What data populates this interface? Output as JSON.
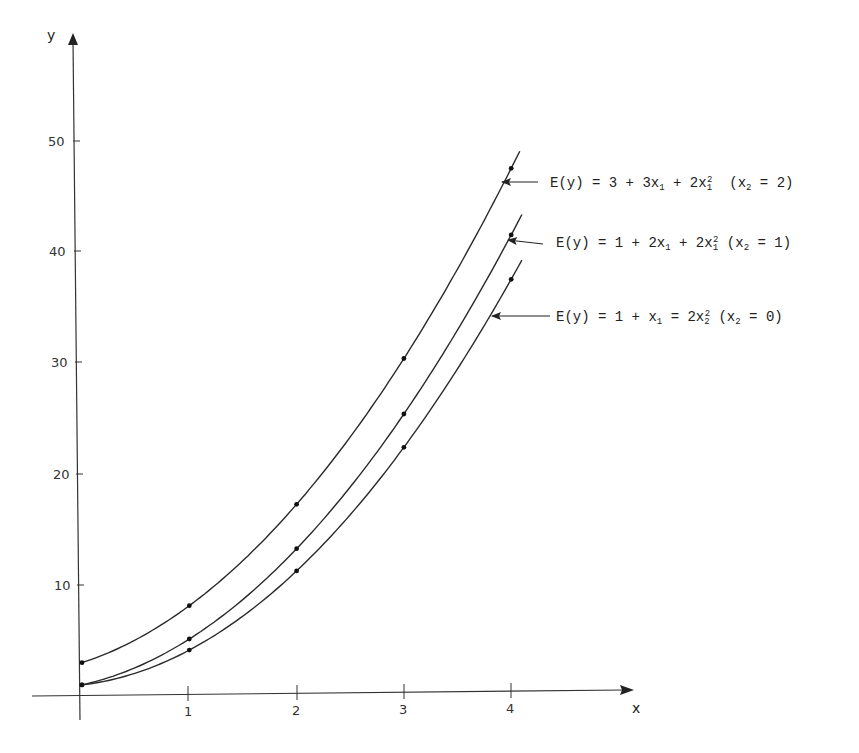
{
  "chart_data": {
    "type": "line",
    "title": "",
    "xlabel": "x",
    "ylabel": "y",
    "xlim": [
      0,
      4.5
    ],
    "ylim": [
      0,
      55
    ],
    "grid": false,
    "x_ticks": [
      "1",
      "2",
      "3",
      "4"
    ],
    "y_ticks": [
      "10",
      "20",
      "30",
      "40",
      "50"
    ],
    "x": [
      0,
      1,
      2,
      3,
      4
    ],
    "series": [
      {
        "name": "E(y) = 3 + 3x1 + 2x1^2 (x2 = 2)",
        "label_parts": [
          "E(y) = 3 + 3x",
          "1",
          " + 2x",
          "1",
          "2",
          "  (x",
          "2",
          " = 2)"
        ],
        "values": [
          3,
          8,
          17,
          30,
          47
        ]
      },
      {
        "name": "E(y) = 1 + 2x1 + 2x1^2 (x2 = 1)",
        "label_parts": [
          "E(y) = 1 + 2x",
          "1",
          " + 2x",
          "1",
          "2",
          "  (x",
          "2",
          " = 1)"
        ],
        "values": [
          1,
          5,
          13,
          25,
          41
        ]
      },
      {
        "name": "E(y) = 1 + x1 = 2x2^2 (x2 = 0)",
        "label_parts": [
          "E(y) = 1 + x",
          "1",
          " = 2x",
          "2",
          "2",
          "  (x",
          "2",
          " = 0)"
        ],
        "values": [
          1,
          4,
          11,
          22,
          37
        ]
      }
    ],
    "annotations": "Each curve labelled by an arrow pointing to it near x = 4",
    "legend_position": "right (arrow annotations)"
  }
}
